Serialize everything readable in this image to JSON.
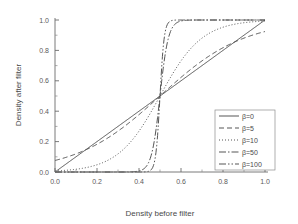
{
  "chart_data": {
    "type": "line",
    "title": "",
    "xlabel": "Density before filter",
    "ylabel": "Density after filter",
    "xlim": [
      0.0,
      1.0
    ],
    "ylim": [
      0.0,
      1.0
    ],
    "grid": false,
    "legend_position": "lower-right",
    "x_ticks": [
      "0.0",
      "0.2",
      "0.4",
      "0.6",
      "0.8",
      "1.0"
    ],
    "x_tick_values": [
      0.0,
      0.2,
      0.4,
      0.6,
      0.8,
      1.0
    ],
    "y_ticks": [
      "0.0",
      "0.2",
      "0.4",
      "0.6",
      "0.8",
      "1.0"
    ],
    "y_tick_values": [
      0.0,
      0.2,
      0.4,
      0.6,
      0.8,
      1.0
    ],
    "x": [
      0.0,
      0.05,
      0.1,
      0.15,
      0.2,
      0.25,
      0.3,
      0.35,
      0.4,
      0.45,
      0.5,
      0.55,
      0.6,
      0.65,
      0.7,
      0.75,
      0.8,
      0.85,
      0.9,
      0.95,
      1.0
    ],
    "series": [
      {
        "name": "β=0",
        "label": "β=0",
        "beta": 0,
        "style": "solid",
        "dash": "none",
        "color": "#4d4d4d",
        "values": [
          0.0,
          0.05,
          0.1,
          0.15,
          0.2,
          0.25,
          0.3,
          0.35,
          0.4,
          0.45,
          0.5,
          0.55,
          0.6,
          0.65,
          0.7,
          0.75,
          0.8,
          0.85,
          0.9,
          0.95,
          1.0
        ]
      },
      {
        "name": "β=5",
        "label": "β=5",
        "beta": 5,
        "style": "dashed",
        "dash": "5,3",
        "color": "#4d4d4d",
        "values": [
          0.0,
          0.002,
          0.006,
          0.012,
          0.023,
          0.041,
          0.071,
          0.119,
          0.194,
          0.304,
          0.5,
          0.696,
          0.806,
          0.881,
          0.929,
          0.959,
          0.977,
          0.988,
          0.994,
          0.998,
          1.0
        ]
      },
      {
        "name": "β=10",
        "label": "β=10",
        "beta": 10,
        "style": "dotted",
        "dash": "1,2",
        "color": "#4d4d4d",
        "values": [
          0.0,
          0.0,
          0.0,
          0.001,
          0.002,
          0.006,
          0.014,
          0.032,
          0.075,
          0.169,
          0.5,
          0.831,
          0.925,
          0.968,
          0.986,
          0.994,
          0.998,
          0.999,
          1.0,
          1.0,
          1.0
        ]
      },
      {
        "name": "β=50",
        "label": "β=50",
        "beta": 50,
        "style": "dashdot",
        "dash": "7,2,1.5,2",
        "color": "#4d4d4d",
        "values": [
          0.0,
          0.0,
          0.0,
          0.0,
          0.0,
          0.0,
          0.0,
          0.0,
          0.003,
          0.025,
          0.5,
          0.975,
          0.997,
          1.0,
          1.0,
          1.0,
          1.0,
          1.0,
          1.0,
          1.0,
          1.0
        ]
      },
      {
        "name": "β=100",
        "label": "β=100",
        "beta": 100,
        "style": "dashdotdot",
        "dash": "7,2,1.5,2,1.5,2",
        "color": "#4d4d4d",
        "values": [
          0.0,
          0.0,
          0.0,
          0.0,
          0.0,
          0.0,
          0.0,
          0.0,
          0.0,
          0.003,
          0.5,
          0.997,
          1.0,
          1.0,
          1.0,
          1.0,
          1.0,
          1.0,
          1.0,
          1.0,
          1.0
        ]
      }
    ]
  }
}
